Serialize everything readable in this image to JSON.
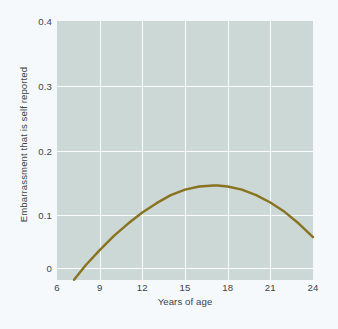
{
  "chart_data": {
    "type": "line",
    "title": "",
    "subtitle": "",
    "xlabel": "Years of age",
    "ylabel": "Embarrassment that is self reported",
    "xlim": [
      6,
      24
    ],
    "ylim": [
      0,
      0.4
    ],
    "xticks": [
      "6",
      "9",
      "12",
      "15",
      "18",
      "21",
      "24"
    ],
    "xtick_values": [
      6,
      9,
      12,
      15,
      18,
      21,
      24
    ],
    "yticks": [
      "0",
      "0.1",
      "0.2",
      "0.3",
      "0.4"
    ],
    "ytick_values": [
      0,
      0.1,
      0.2,
      0.3,
      0.4
    ],
    "grid": true,
    "legend": "none",
    "series": [
      {
        "name": "Embarrassment (quadratic fit)",
        "color": "#8a7320",
        "x": [
          7.2,
          8,
          9,
          10,
          11,
          12,
          13,
          14,
          15,
          16,
          17,
          17.3,
          18,
          19,
          20,
          21,
          22,
          23,
          24
        ],
        "y": [
          -0.019,
          0.004,
          0.029,
          0.052,
          0.072,
          0.09,
          0.105,
          0.118,
          0.127,
          0.132,
          0.1335,
          0.1335,
          0.132,
          0.127,
          0.118,
          0.106,
          0.091,
          0.072,
          0.05
        ]
      }
    ],
    "colors": {
      "plot_background": "#ccd8d6",
      "page_background": "#f6f9fb",
      "gridline": "#ffffff",
      "curve": "#8a7320",
      "text": "#3b4448"
    }
  },
  "axes": {
    "y_label_text": "Embarrassment that is self reported",
    "x_label_text": "Years of age",
    "y_tick_labels": [
      "0.4",
      "0.3",
      "0.2",
      "0.1",
      "0"
    ],
    "x_tick_labels": [
      "6",
      "9",
      "12",
      "15",
      "18",
      "21",
      "24"
    ]
  }
}
